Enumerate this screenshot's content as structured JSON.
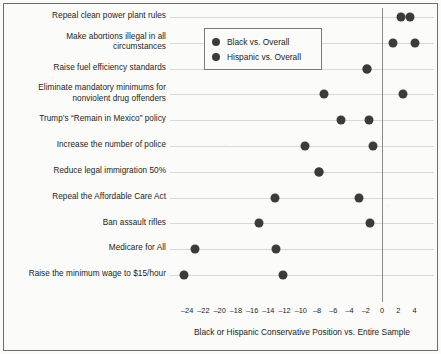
{
  "chart_data": {
    "type": "scatter",
    "title": "",
    "subtitle": "",
    "xlabel": "Black or Hispanic Conservative Position vs. Entire Sample",
    "ylabel": "",
    "xlim": [
      -26,
      5.5
    ],
    "xticks": [
      -24,
      -22,
      -20,
      -18,
      -16,
      -14,
      -12,
      -10,
      -8,
      -6,
      -4,
      -2,
      0,
      2,
      4
    ],
    "xticklabels": [
      "–24",
      "–22",
      "–20",
      "–18",
      "–16",
      "–14",
      "–12",
      "–10",
      "–8",
      "–6",
      "–4",
      "–2",
      "0",
      "2",
      "4"
    ],
    "grid": "horizontal",
    "zero_reference_line": 0,
    "legend_position": "top-center",
    "marker_color": "#3b3b3b",
    "categories": [
      "Repeal clean power plant rules",
      "Make abortions illegal in all\ncircumstances",
      "Raise fuel efficiency standards",
      "Eliminate mandatory minimums for\nnonviolent drug offenders",
      "Trump’s “Remain in Mexico” policy",
      "Increase the number of police",
      "Reduce legal immigration 50%",
      "Repeal the Affordable Care Act",
      "Ban assault rifles",
      "Medicare for All",
      "Raise the minimum wage to $15/hour"
    ],
    "series": [
      {
        "name": "Black vs. Overall",
        "values": [
          3.4,
          1.4,
          -1.8,
          -7.2,
          -5.1,
          -9.5,
          -7.8,
          -13.2,
          -15.1,
          -23.0,
          -24.4
        ]
      },
      {
        "name": "Hispanic vs. Overall",
        "values": [
          2.4,
          4.1,
          -1.8,
          2.6,
          -1.6,
          -1.1,
          -7.8,
          -2.8,
          -1.5,
          -13.1,
          -12.2
        ]
      }
    ]
  },
  "legend": {
    "items": [
      {
        "label": "Black vs. Overall"
      },
      {
        "label": "Hispanic vs. Overall"
      }
    ]
  }
}
